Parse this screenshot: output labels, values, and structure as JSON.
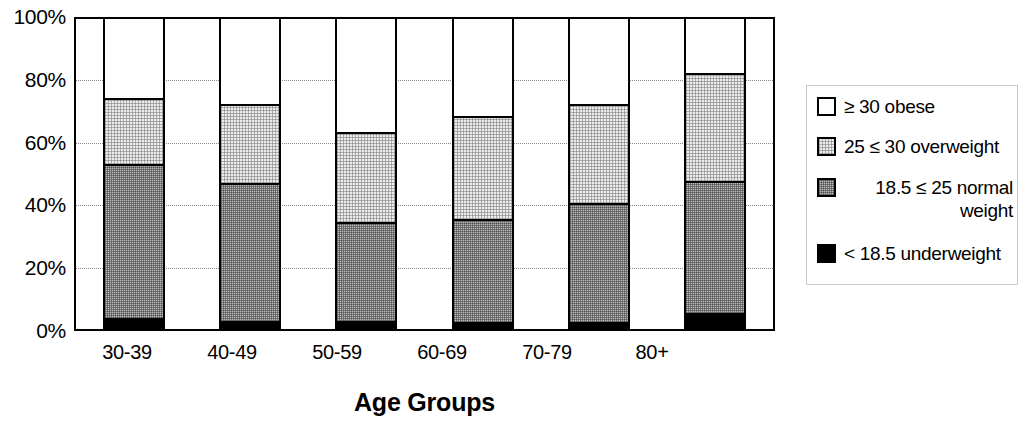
{
  "chart_data": {
    "type": "bar",
    "subtype": "stacked-bar-100-percent",
    "title": "",
    "xlabel": "Age Groups",
    "ylabel": "",
    "ylim": [
      0,
      100
    ],
    "y_unit": "%",
    "grid": true,
    "legend_position": "right",
    "categories": [
      "30-39",
      "40-49",
      "50-59",
      "60-69",
      "70-79",
      "80+"
    ],
    "y_tick_labels": [
      "100%",
      "80%",
      "60%",
      "40%",
      "20%",
      "0%"
    ],
    "y_tick_values": [
      100,
      80,
      60,
      40,
      20,
      0
    ],
    "series": [
      {
        "name": "< 18.5 underweight",
        "key": "underweight",
        "color": "#000000",
        "fill": "solid-black",
        "values": [
          3,
          2,
          2,
          1.5,
          1.5,
          4.5
        ]
      },
      {
        "name": "18.5 ≤ 25 normal weight",
        "key": "normal",
        "color": "#bdbdbd",
        "fill": "dense-gray-dither",
        "values": [
          49.5,
          44.5,
          32,
          33.5,
          38.5,
          42.5
        ]
      },
      {
        "name": "25 ≤ 30 overweight",
        "key": "overweight",
        "color": "#ececec",
        "fill": "light-gray-dither",
        "values": [
          21.5,
          25.5,
          29,
          33,
          32,
          35
        ]
      },
      {
        "name": "≥ 30 obese",
        "key": "obese",
        "color": "#ffffff",
        "fill": "white",
        "values": [
          26,
          28,
          37,
          32,
          28,
          18
        ]
      }
    ],
    "cumulative_tops": {
      "underweight": [
        3,
        2,
        2,
        1.5,
        1.5,
        4.5
      ],
      "normal": [
        52.5,
        46.5,
        34,
        35,
        40,
        47
      ],
      "overweight": [
        74,
        72,
        63,
        68,
        72,
        82
      ],
      "obese": [
        100,
        100,
        100,
        100,
        100,
        100
      ]
    }
  },
  "axis": {
    "y_labels": [
      "100%",
      "80%",
      "60%",
      "40%",
      "20%",
      "0%"
    ],
    "x_labels": [
      "30-39",
      "40-49",
      "50-59",
      "60-69",
      "70-79",
      "80+"
    ],
    "x_title": "Age Groups"
  },
  "legend": {
    "items": [
      {
        "label": "≥ 30 obese",
        "swatch": "obese"
      },
      {
        "label": "25 ≤ 30 overweight",
        "swatch": "overweight"
      },
      {
        "label": "18.5 ≤ 25 normal\nweight",
        "swatch": "normal"
      },
      {
        "label": "< 18.5 underweight",
        "swatch": "underweight"
      }
    ]
  },
  "colors": {
    "obese": "#ffffff",
    "overweight": "#ececec",
    "normal": "#bdbdbd",
    "underweight": "#000000",
    "axis": "#000000",
    "gridline": "#8a8a8a"
  }
}
